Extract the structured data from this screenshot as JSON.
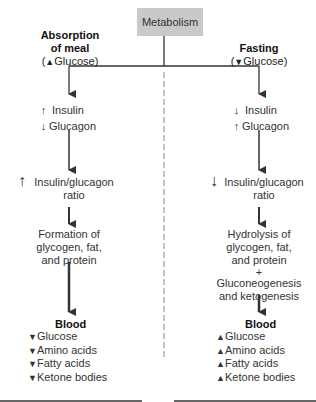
{
  "root": {
    "label": "Metabolism"
  },
  "divider": {
    "style": "dashed"
  },
  "left_branch": {
    "title": "Absorption of meal",
    "title_line1": "Absorption",
    "title_line2": "of meal",
    "condition": "Glucose",
    "condition_direction": "up",
    "hormones": [
      {
        "direction": "up",
        "label": "Insulin"
      },
      {
        "direction": "down",
        "label": "Glucagon"
      }
    ],
    "ratio": {
      "direction": "up",
      "line1": "Insulin/glucagon",
      "line2": "ratio"
    },
    "process": {
      "line1": "Formation of",
      "line2": "glycogen, fat,",
      "line3": "and protein"
    },
    "blood": {
      "title": "Blood",
      "items": [
        {
          "direction": "down",
          "label": "Glucose"
        },
        {
          "direction": "down",
          "label": "Amino acids"
        },
        {
          "direction": "down",
          "label": "Fatty acids"
        },
        {
          "direction": "down",
          "label": "Ketone bodies"
        }
      ]
    }
  },
  "right_branch": {
    "title": "Fasting",
    "condition": "Glucose",
    "condition_direction": "down",
    "hormones": [
      {
        "direction": "down",
        "label": "Insulin"
      },
      {
        "direction": "up",
        "label": "Glucagon"
      }
    ],
    "ratio": {
      "direction": "down",
      "line1": "Insulin/glucagon",
      "line2": "ratio"
    },
    "process": {
      "line1": "Hydrolysis of",
      "line2": "glycogen, fat,",
      "line3": "and protein",
      "plus": "+",
      "line4": "Gluconeogenesis",
      "line5": "and ketogenesis"
    },
    "blood": {
      "title": "Blood",
      "items": [
        {
          "direction": "up",
          "label": "Glucose"
        },
        {
          "direction": "up",
          "label": "Amino acids"
        },
        {
          "direction": "up",
          "label": "Fatty acids"
        },
        {
          "direction": "up",
          "label": "Ketone bodies"
        }
      ]
    }
  },
  "glyphs": {
    "up": "▲",
    "down": "▼",
    "up_arrow": "↑",
    "down_arrow": "↓"
  }
}
